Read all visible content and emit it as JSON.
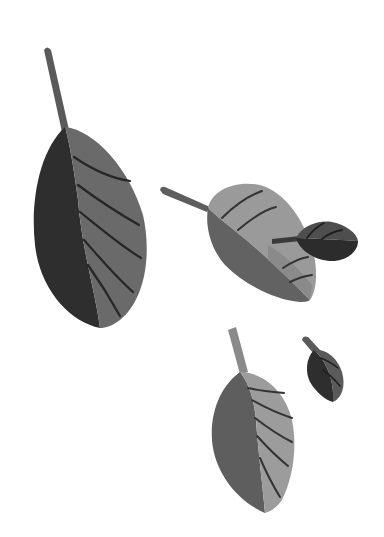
{
  "illustration": {
    "title": "Falling leaves",
    "background": "#ffffff",
    "colors": {
      "leaf_darkest": "#2b2b2b",
      "leaf_dark": "#3a3a3a",
      "leaf_mid_dark": "#555555",
      "leaf_mid": "#6e6e6e",
      "leaf_light": "#8c8c8c",
      "leaf_lightest": "#a6a6a6",
      "vein": "#262626"
    },
    "leaves": [
      {
        "id": "large-leaf-left",
        "label": "Large dark leaf with long stem"
      },
      {
        "id": "medium-leaf-center",
        "label": "Medium light leaf, tilted horizontally"
      },
      {
        "id": "small-leaf-right",
        "label": "Small dark leaf overlapping medium leaf"
      },
      {
        "id": "medium-leaf-bottom",
        "label": "Medium gray leaf at bottom"
      },
      {
        "id": "tiny-leaf-bottom-right",
        "label": "Tiny dark leaf at bottom right"
      }
    ]
  }
}
